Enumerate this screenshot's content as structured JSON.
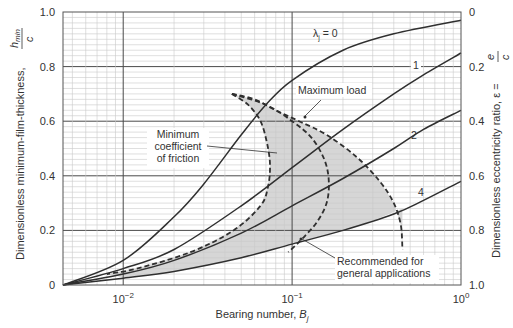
{
  "chart_data": {
    "type": "line",
    "title": "",
    "xlabel": "Bearing number, B_j",
    "xlabel_main": "Bearing number, ",
    "xlabel_sym": "B",
    "xlabel_sub": "j",
    "ylabel": "Dimensionless minimum-film-thickness, h_min / c",
    "ylabel_main": "Dimensionless minimum-film-thickness,",
    "ylabel_frac_num": "h",
    "ylabel_frac_num_sub": "min",
    "ylabel_frac_den": "c",
    "y2label": "Dimensionless eccentricity ratio, ε = e / c",
    "y2label_main": "Dimensionless eccentricity ratio, ε =",
    "y2label_frac_num": "e",
    "y2label_frac_den": "c",
    "xscale": "log",
    "xlim": [
      0.0044,
      1.0
    ],
    "ylim": [
      0,
      1.0
    ],
    "y2lim": [
      1.0,
      0
    ],
    "grid": true,
    "x_ticks": [
      {
        "value": 0.01,
        "base": "10",
        "exp": "−2"
      },
      {
        "value": 0.1,
        "base": "10",
        "exp": "−1"
      },
      {
        "value": 1.0,
        "base": "10",
        "exp": "0"
      }
    ],
    "y_ticks": [
      "0",
      "0.2",
      "0.4",
      "0.6",
      "0.8",
      "1.0"
    ],
    "y2_ticks": [
      "1.0",
      "0.8",
      "0.6",
      "0.4",
      "0.2",
      "0"
    ],
    "series": [
      {
        "name": "λj = 0",
        "label": "λ",
        "label_sub": "j",
        "label_rest": " = 0",
        "style": "solid",
        "x": [
          0.0044,
          0.01,
          0.02,
          0.03,
          0.05,
          0.07,
          0.1,
          0.2,
          0.4,
          1.0
        ],
        "y": [
          0.0,
          0.09,
          0.25,
          0.37,
          0.55,
          0.66,
          0.75,
          0.86,
          0.92,
          0.97
        ]
      },
      {
        "name": "λj = 1",
        "label": "1",
        "style": "solid",
        "x": [
          0.0044,
          0.01,
          0.02,
          0.05,
          0.1,
          0.2,
          0.4,
          0.6,
          1.0
        ],
        "y": [
          0.0,
          0.06,
          0.13,
          0.29,
          0.43,
          0.57,
          0.7,
          0.77,
          0.85
        ]
      },
      {
        "name": "λj = 2",
        "label": "2",
        "style": "solid",
        "x": [
          0.0044,
          0.01,
          0.02,
          0.05,
          0.1,
          0.2,
          0.4,
          0.6,
          1.0
        ],
        "y": [
          0.0,
          0.04,
          0.09,
          0.19,
          0.29,
          0.39,
          0.5,
          0.57,
          0.64
        ]
      },
      {
        "name": "λj = 4",
        "label": "4",
        "style": "solid",
        "x": [
          0.0044,
          0.01,
          0.02,
          0.05,
          0.1,
          0.2,
          0.4,
          0.6,
          1.0
        ],
        "y": [
          0.0,
          0.025,
          0.05,
          0.1,
          0.15,
          0.2,
          0.26,
          0.31,
          0.38
        ]
      },
      {
        "name": "Maximum load",
        "style": "dashed",
        "x": [
          0.044,
          0.06,
          0.08,
          0.11,
          0.16,
          0.24,
          0.33,
          0.4,
          0.44,
          0.45
        ],
        "y": [
          0.7,
          0.68,
          0.64,
          0.6,
          0.55,
          0.47,
          0.38,
          0.3,
          0.22,
          0.13
        ]
      },
      {
        "name": "Minimum coefficient of friction",
        "style": "dashed",
        "x": [
          0.044,
          0.055,
          0.065,
          0.071,
          0.074,
          0.072,
          0.065,
          0.045,
          0.025,
          0.012,
          0.008
        ],
        "y": [
          0.7,
          0.66,
          0.6,
          0.52,
          0.44,
          0.36,
          0.29,
          0.2,
          0.12,
          0.06,
          0.04
        ]
      },
      {
        "name": "Middle boundary (recommended region)",
        "style": "dashed",
        "x": [
          0.044,
          0.07,
          0.1,
          0.13,
          0.155,
          0.165,
          0.16,
          0.14,
          0.115,
          0.095
        ],
        "y": [
          0.7,
          0.66,
          0.6,
          0.54,
          0.46,
          0.38,
          0.3,
          0.23,
          0.17,
          0.12
        ]
      }
    ],
    "region": {
      "name": "Recommended operating region (shaded)",
      "color": "#d6d6d6"
    },
    "annotations": [
      {
        "text": "Maximum load",
        "x": 0.105,
        "y": 0.69
      },
      {
        "text": "Minimum coefficient of friction",
        "lines": [
          "Minimum",
          "coefficient",
          "of friction"
        ],
        "x": 0.028,
        "y": 0.48
      },
      {
        "text": "Recommended for general applications",
        "lines": [
          "Recommended for",
          "general applications"
        ],
        "x": 0.22,
        "y": 0.15
      }
    ]
  },
  "colors": {
    "line": "#2f2f2f",
    "grid_major": "#4a4a4a",
    "grid_minor": "#c9c9c9",
    "shade": "#d6d6d6",
    "text": "#333333"
  }
}
